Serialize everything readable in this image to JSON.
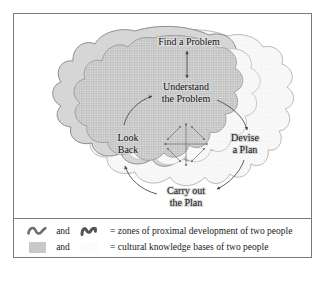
{
  "figure": {
    "nodes": [
      {
        "id": "find",
        "lines": [
          "Find a Problem"
        ],
        "x": 175,
        "y": 28
      },
      {
        "id": "understand",
        "lines": [
          "Understand",
          "the Problem"
        ],
        "x": 172,
        "y": 77
      },
      {
        "id": "devise",
        "lines": [
          "Devise",
          "a Plan"
        ],
        "x": 229,
        "y": 128
      },
      {
        "id": "carry",
        "lines": [
          "Carry out",
          "the Plan"
        ],
        "x": 172,
        "y": 178
      },
      {
        "id": "look",
        "lines": [
          "Look",
          "Back"
        ],
        "x": 114,
        "y": 128
      }
    ],
    "center_cluster": {
      "description": "bidirectional cross and diamond of double-headed arrows",
      "cx": 172,
      "cy": 130
    }
  },
  "legend": {
    "rows": [
      {
        "symbol_left": "dark-wavy-line",
        "conjunction": "and",
        "symbol_right": "dark-zigzag-line",
        "equals": "=",
        "text": "= zones of proximal development of two people"
      },
      {
        "symbol_left": "gray-filled-swatch",
        "conjunction": "and",
        "symbol_right": "light-dotted-swatch",
        "equals": "=",
        "text": "= cultural knowledge bases of two people"
      }
    ]
  },
  "colors": {
    "frame_border": "#7a7a7a",
    "blob_left_fill": "#d5d5d5",
    "blob_right_fill": "#fafafa",
    "zpd_left_fill": "#c6c6c6",
    "zpd_right_fill": "#f2f2f2",
    "outline": "#6e6e6e",
    "text": "#111111",
    "arrow": "#4a4a4a"
  }
}
